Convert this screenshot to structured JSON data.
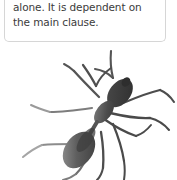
{
  "background_color": "#ffffff",
  "callout": {
    "text": "alone. It is dependent on\nthe main clause.",
    "line1": "alone. It is dependent on",
    "line2": "the main clause.",
    "border_color": "#d6d6d6",
    "background_color": "#ffffff",
    "text_color": "#3b3b3b"
  },
  "illustration": {
    "name": "ant-illustration",
    "subject": "ant",
    "description": "Black-and-white photographic silhouette of an ant viewed from above, head toward the upper right, abdomen toward the lower left, with six legs and two antennae splayed outward.",
    "body_color": "#3a3a3a",
    "limb_color": "#555555",
    "highlight_color": "#8a8a8a",
    "parts": [
      "head",
      "thorax",
      "petiole",
      "gaster",
      "antenna-left",
      "antenna-right",
      "leg-front-left",
      "leg-front-right",
      "leg-middle-left",
      "leg-middle-right",
      "leg-hind-left",
      "leg-hind-right"
    ]
  }
}
